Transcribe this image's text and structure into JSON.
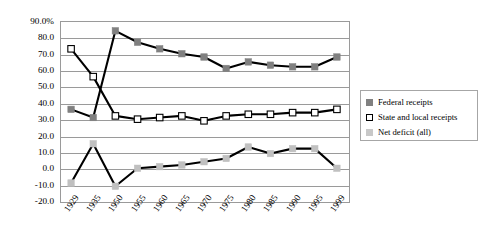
{
  "chart_data": {
    "type": "line",
    "title": "",
    "subtitle": "",
    "xlabel": "",
    "ylabel": "",
    "grid": true,
    "legend_position": "right",
    "ylim": [
      -20,
      90
    ],
    "ytick_labels": [
      "90.0%",
      "80.0",
      "70.0",
      "60.0",
      "50.0",
      "40.0",
      "30.0",
      "20.0",
      "10.0",
      "0.0",
      "-10.0",
      "-20.0"
    ],
    "ytick_values": [
      90,
      80,
      70,
      60,
      50,
      40,
      30,
      20,
      10,
      0,
      -10,
      -20
    ],
    "categories": [
      "1929",
      "1935",
      "1950",
      "1955",
      "1960",
      "1965",
      "1970",
      "1975",
      "1980",
      "1985",
      "1990",
      "1995",
      "1999"
    ],
    "series": [
      {
        "name": "Federal receipts",
        "marker": "filled-square",
        "color": "#808080",
        "values": [
          36.0,
          31.0,
          84.0,
          77.0,
          73.0,
          70.0,
          68.0,
          61.0,
          65.0,
          63.0,
          62.0,
          62.0,
          68.0
        ]
      },
      {
        "name": "State and local receipts",
        "marker": "open-square",
        "color": "#ffffff",
        "values": [
          73.0,
          56.0,
          32.0,
          30.0,
          31.0,
          32.0,
          29.0,
          32.0,
          33.0,
          33.0,
          34.0,
          34.0,
          36.0
        ]
      },
      {
        "name": "Net deficit (all)",
        "marker": "filled-square",
        "color": "#c0c0c0",
        "values": [
          -9.0,
          15.0,
          -11.0,
          0.0,
          1.0,
          2.0,
          4.0,
          6.0,
          13.0,
          9.0,
          12.0,
          12.0,
          0.0
        ]
      }
    ]
  },
  "legend": {
    "entries": [
      {
        "label": "Federal receipts",
        "swatch": "dark-gray-filled-square",
        "color": "#808080",
        "border": "#808080"
      },
      {
        "label": "State and local receipts",
        "swatch": "white-open-square",
        "color": "#ffffff",
        "border": "#000000"
      },
      {
        "label": "Net deficit (all)",
        "swatch": "light-gray-filled-square",
        "color": "#c8c8c8",
        "border": "#c8c8c8"
      }
    ]
  },
  "colors": {
    "axis": "#9a9a9a",
    "grid": "#9a9a9a",
    "line": "#000000",
    "federal": "#808080",
    "state_local": "#ffffff",
    "net_deficit": "#c0c0c0",
    "text": "#000000",
    "background": "#ffffff"
  }
}
